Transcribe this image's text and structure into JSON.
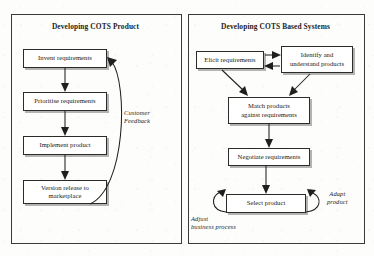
{
  "figure": {
    "kind": "process-comparison-diagram",
    "background_color": "#fdfdfc",
    "line_color": "#1f1f1d",
    "box_fill": "#ffffff",
    "shadow_color": "#787876"
  },
  "left_panel": {
    "title": "Developing COTS Product",
    "nodes": [
      {
        "id": "invent",
        "label": "Invent requirements"
      },
      {
        "id": "prioritise",
        "label": "Prioritise requirements"
      },
      {
        "id": "implement",
        "label": "Implement product"
      },
      {
        "id": "release",
        "label": "Version release to marketplace"
      }
    ],
    "annotations": [
      {
        "id": "customer-feedback",
        "line1": "Customer",
        "line2": "Feedback"
      }
    ],
    "flow": [
      "invent -> prioritise",
      "prioritise -> implement",
      "implement -> release",
      "release -> invent (Customer Feedback)"
    ]
  },
  "right_panel": {
    "title": "Developing COTS Based Systems",
    "nodes": [
      {
        "id": "elicit",
        "label": "Elicit requirements"
      },
      {
        "id": "identify",
        "line1": "Identify and",
        "line2": "understand products"
      },
      {
        "id": "match",
        "line1": "Match products",
        "line2": "against requirements"
      },
      {
        "id": "negotiate",
        "label": "Negotiate requirements"
      },
      {
        "id": "select",
        "label": "Select product"
      }
    ],
    "annotations": [
      {
        "id": "adapt-product",
        "line1": "Adapt",
        "line2": "product"
      },
      {
        "id": "adjust-business",
        "line1": "Adjust",
        "line2": "business process"
      }
    ],
    "flow": [
      "elicit <-> identify",
      "elicit -> match",
      "identify -> match",
      "match -> negotiate",
      "negotiate -> select",
      "select -> select (Adapt product)",
      "select -> select (Adjust business process)"
    ]
  }
}
